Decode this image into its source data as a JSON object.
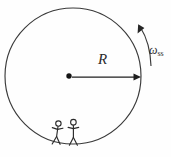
{
  "figure": {
    "background_color": "#fefefe",
    "stroke_color": "#3a3a3a",
    "labels": {
      "radius": "R",
      "angular_speed_symbol": "ω",
      "angular_speed_subscript": "ss",
      "angular_speed_full": "ωss"
    },
    "geometry": {
      "circle_center_x": 73,
      "circle_center_y": 76,
      "circle_radius": 68,
      "center_dot_x": 69,
      "center_dot_y": 76,
      "center_dot_radius": 2.6,
      "radius_arrow_from_x": 72,
      "radius_arrow_to_x": 139,
      "radius_arrow_y": 77,
      "rotation_arrow_direction": "counterclockwise"
    },
    "elements": [
      {
        "name": "station-circle",
        "kind": "circle-outline"
      },
      {
        "name": "center-dot",
        "kind": "filled-dot"
      },
      {
        "name": "radius-arrow",
        "kind": "arrow-right"
      },
      {
        "name": "rotation-arrow",
        "kind": "curved-arrow"
      },
      {
        "name": "stick-figure-left",
        "kind": "stick-figure"
      },
      {
        "name": "stick-figure-right",
        "kind": "stick-figure"
      }
    ]
  }
}
